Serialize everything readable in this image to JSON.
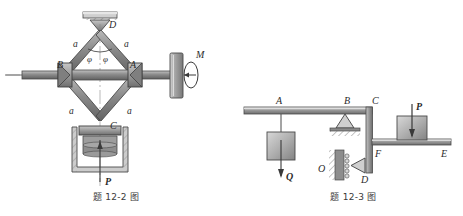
{
  "page": {
    "background_color": "#ffffff",
    "width": 463,
    "height": 216
  },
  "figures": [
    {
      "id": "toggle-press-mechanism",
      "caption": "题 12-2 图",
      "description": "Toggle (knuckle) press mechanism driven by torque M through a horizontal screw shaft",
      "labels": {
        "joint_top": "D",
        "joint_left": "B",
        "joint_right": "A",
        "joint_bottom": "C",
        "bar_upper_left": "a",
        "bar_upper_right": "a",
        "bar_lower_left": "a",
        "bar_lower_right": "a",
        "angle_left": "φ",
        "angle_right": "φ",
        "torque": "M",
        "force": "P"
      },
      "colors": {
        "bar_fill": "#8d8d8d",
        "bar_edge": "#4a4a4a",
        "block_fill": "#a5a5a5",
        "hatch": "#6e6e6e",
        "line": "#3a3a3a"
      }
    },
    {
      "id": "bent-beam-frame",
      "caption": "题 12-3 图",
      "description": "Horizontal beam ABC with hanging load Q, pin support B, vertical member CD with pin at D and shelf FE carrying block P",
      "labels": {
        "point_a": "A",
        "point_b": "B",
        "point_c": "C",
        "point_d": "D",
        "point_e": "E",
        "point_f": "F",
        "point_o": "O",
        "load_hanging": "Q",
        "load_block": "P"
      },
      "colors": {
        "beam_fill": "#9a9a9a",
        "beam_edge": "#4a4a4a",
        "block_fill": "#b0b0b0",
        "hatch": "#6e6e6e",
        "line": "#3a3a3a"
      }
    }
  ]
}
